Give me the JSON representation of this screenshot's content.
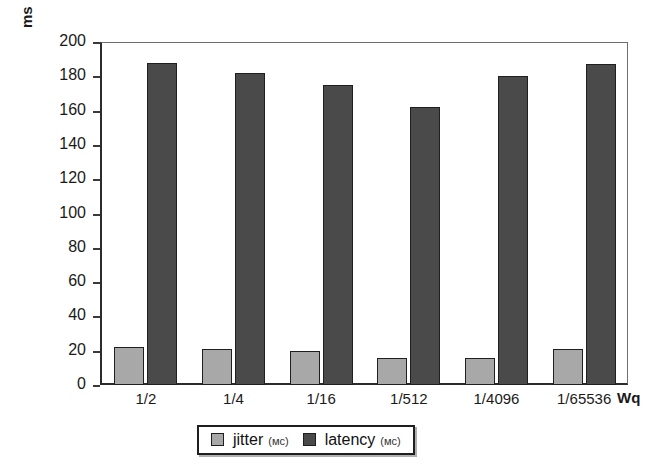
{
  "chart_data": {
    "type": "bar",
    "title": "",
    "xlabel": "Wq",
    "ylabel": "ms",
    "ylim": [
      0,
      200
    ],
    "yticks": [
      0,
      20,
      40,
      60,
      80,
      100,
      120,
      140,
      160,
      180,
      200
    ],
    "ytick_labels": [
      "0",
      "20",
      "40",
      "60",
      "80",
      "100",
      "120",
      "140",
      "160",
      "180",
      "200"
    ],
    "grid": false,
    "legend_position": "bottom-center",
    "categories": [
      "1/2",
      "1/4",
      "1/16",
      "1/512",
      "1/4096",
      "1/65536"
    ],
    "series": [
      {
        "name": "jitter",
        "unit": "(мс)",
        "color": "#a8a8a8",
        "values": [
          22,
          21,
          20,
          16,
          16,
          21
        ]
      },
      {
        "name": "latency",
        "unit": "(мс)",
        "color": "#4a4a4a",
        "values": [
          188,
          182,
          175,
          162,
          180,
          187
        ]
      }
    ]
  },
  "legend": {
    "items": [
      {
        "label": "jitter",
        "unit": "(мс)",
        "swatch": "#a8a8a8"
      },
      {
        "label": "latency",
        "unit": "(мс)",
        "swatch": "#4a4a4a"
      }
    ]
  },
  "axes": {
    "y_unit_label": "ms",
    "x_unit_label": "Wq"
  }
}
